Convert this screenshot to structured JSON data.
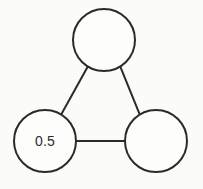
{
  "canvas": {
    "width": 203,
    "height": 189,
    "background_color": "#fbfbfa",
    "stroke_color": "#2a2a2a",
    "stroke_width": 2,
    "node_fill": "#fdfdfc",
    "label_color": "#2c2c2c"
  },
  "diagram": {
    "type": "node-link-graph",
    "shape": "triangle",
    "node_count": 3,
    "edge_count": 3,
    "nodes": [
      {
        "id": "node-top",
        "label": "",
        "cx": 104,
        "cy": 40,
        "r": 31
      },
      {
        "id": "node-bottom-left",
        "label": "0.5",
        "cx": 45,
        "cy": 141,
        "r": 31
      },
      {
        "id": "node-bottom-right",
        "label": "",
        "cx": 156,
        "cy": 141,
        "r": 31
      }
    ],
    "edges": [
      {
        "id": "edge-top-left",
        "from": "node-top",
        "to": "node-bottom-left",
        "label": "",
        "x1": 87.8,
        "y1": 66.4,
        "x2": 61.2,
        "y2": 114.6
      },
      {
        "id": "edge-top-right",
        "from": "node-top",
        "to": "node-bottom-right",
        "label": "",
        "x1": 120.2,
        "y1": 66.4,
        "x2": 139.8,
        "y2": 114.6
      },
      {
        "id": "edge-left-right",
        "from": "node-bottom-left",
        "to": "node-bottom-right",
        "label": "",
        "x1": 76,
        "y1": 141,
        "x2": 125,
        "y2": 141
      }
    ]
  }
}
